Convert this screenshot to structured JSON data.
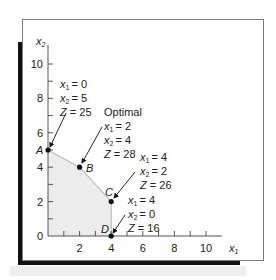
{
  "axes": {
    "x_label": "x",
    "x_label_sub": "1",
    "y_label": "x",
    "y_label_sub": "2",
    "x_ticks": [
      "2",
      "4",
      "6",
      "8",
      "10"
    ],
    "y_ticks": [
      "0",
      "2",
      "4",
      "6",
      "8",
      "10"
    ]
  },
  "points": [
    {
      "name": "A",
      "x1": 0,
      "x2": 5,
      "annotation": [
        "x1 = 0",
        "x2 = 5",
        "Z = 25"
      ]
    },
    {
      "name": "B",
      "x1": 2,
      "x2": 4,
      "title": "Optimal",
      "annotation": [
        "x1 = 2",
        "x2 = 4",
        "Z = 28"
      ]
    },
    {
      "name": "C",
      "x1": 4,
      "x2": 2,
      "annotation": [
        "x1 = 4",
        "x2 = 2",
        "Z = 26"
      ]
    },
    {
      "name": "D",
      "x1": 4,
      "x2": 0,
      "annotation": [
        "x1 = 4",
        "x2 = 0",
        "Z = 16"
      ]
    }
  ],
  "labels": {
    "A": "A",
    "B": "B",
    "C": "C",
    "D": "D",
    "optimal": "Optimal",
    "a1": "= 0",
    "a2": "= 5",
    "a3": "Z = 25",
    "b1": "= 2",
    "b2": "= 4",
    "b3": "Z = 28",
    "c1": "= 4",
    "c2": "= 2",
    "c3": "Z = 26",
    "d1": "= 4",
    "d2": "= 0",
    "d3": "Z = 16",
    "x": "x",
    "sub1": "1",
    "sub2": "2",
    "Z": "Z"
  },
  "colors": {
    "feasible_region": "#ececec",
    "boundary": "#bdbdbd",
    "axis": "#555555",
    "point": "#111111"
  }
}
